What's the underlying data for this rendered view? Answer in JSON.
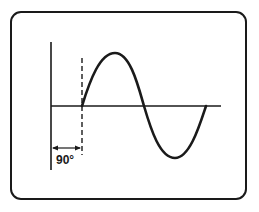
{
  "diagram": {
    "title": "",
    "phase_label": "90°",
    "colors": {
      "stroke": "#1a1a1a",
      "background": "#ffffff"
    },
    "elements": {
      "frame": "oscilloscope-screen",
      "vertical_axis": "reference-axis",
      "horizontal_axis": "time-axis",
      "dashed_marker": "phase-shift-marker",
      "waveform": "sine-wave",
      "dimension_arrow": "phase-offset-arrow"
    }
  }
}
